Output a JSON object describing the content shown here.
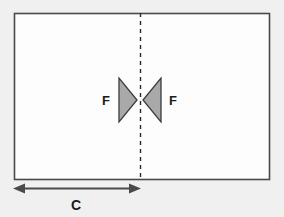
{
  "diagram": {
    "background_color": "#f0f0f0",
    "plate": {
      "name": "rectangular-plate",
      "fill_color": "#fdfdfd",
      "stroke_color": "#4a4a4a",
      "x": 14,
      "y": 13,
      "width": 256,
      "height": 167
    },
    "centerline": {
      "name": "dashed-centerline",
      "stroke_color": "#2b2b2b",
      "x": 140,
      "y_top": 13,
      "y_bottom": 180,
      "dash_pattern": "4 4"
    },
    "forces": [
      {
        "id": "force-left",
        "label": "F",
        "direction": "right",
        "label_x": 106,
        "label_y": 105,
        "fill_color": "#a9a9a9",
        "stroke_color": "#3c3c3c",
        "points": "119,78 119,122 137,100"
      },
      {
        "id": "force-right",
        "label": "F",
        "direction": "left",
        "label_x": 166,
        "label_y": 105,
        "fill_color": "#a9a9a9",
        "stroke_color": "#3c3c3c",
        "points": "161,78 161,122 143,100"
      }
    ],
    "dimension": {
      "name": "chord-dimension",
      "label": "C",
      "label_x": 76,
      "label_y": 207,
      "stroke_color": "#4a4a4a",
      "x_start": 14,
      "x_end": 140,
      "y": 188
    }
  }
}
